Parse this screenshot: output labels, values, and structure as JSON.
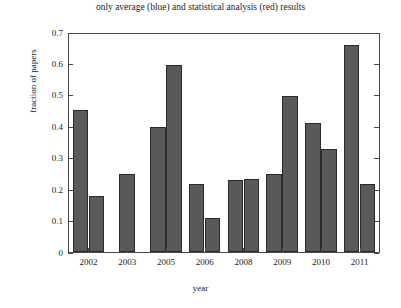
{
  "chart_data": {
    "type": "bar",
    "title": "only average (blue) and statistical analysis (red) results",
    "xlabel": "year",
    "ylabel": "fraction of papers",
    "categories": [
      "2002",
      "2003",
      "2005",
      "2006",
      "2008",
      "2009",
      "2010",
      "2011"
    ],
    "series": [
      {
        "name": "only average (blue)",
        "values": [
          0.455,
          0.25,
          0.4,
          0.22,
          0.23,
          0.25,
          0.415,
          0.665
        ]
      },
      {
        "name": "statistical analysis (red)",
        "values": [
          0.18,
          null,
          0.6,
          0.11,
          0.235,
          0.5,
          0.33,
          0.22
        ]
      }
    ],
    "ylim": [
      0,
      0.7
    ],
    "ytick_labels": [
      "0",
      "0.1",
      "0.2",
      "0.3",
      "0.4",
      "0.5",
      "0.6",
      "0.7"
    ],
    "ytick_values": [
      0,
      0.1,
      0.2,
      0.3,
      0.4,
      0.5,
      0.6,
      0.7
    ],
    "grid": false,
    "legend": "none",
    "bar_color": "#595959",
    "bar_edge_color": "#2b2b2b",
    "axis_color": "#4a4a4a"
  }
}
